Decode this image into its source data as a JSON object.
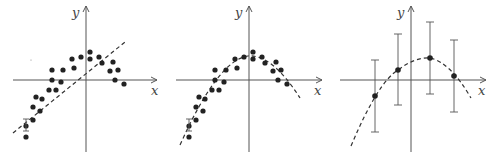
{
  "panels": [
    {
      "name": "linear-fit-underfit",
      "x_label": "x",
      "y_label": "y",
      "fit": "straight dashed line",
      "points": [
        [
          52,
          70
        ],
        [
          52,
          80
        ],
        [
          61,
          82
        ],
        [
          49,
          90
        ],
        [
          56,
          90
        ],
        [
          36,
          97
        ],
        [
          42,
          99
        ],
        [
          33,
          107
        ],
        [
          40,
          111
        ],
        [
          33,
          120
        ],
        [
          26,
          126
        ],
        [
          26,
          137
        ],
        [
          63,
          70
        ],
        [
          72,
          59
        ],
        [
          74,
          68
        ],
        [
          81,
          57
        ],
        [
          90,
          52
        ],
        [
          90,
          59
        ],
        [
          99,
          57
        ],
        [
          102,
          63
        ],
        [
          113,
          62
        ],
        [
          110,
          71
        ],
        [
          118,
          70
        ],
        [
          115,
          80
        ],
        [
          124,
          84
        ]
      ]
    },
    {
      "name": "quadratic-fit-good",
      "x_label": "x",
      "y_label": "y",
      "fit": "dashed parabola"
    },
    {
      "name": "sparse-points-with-error-bars",
      "x_label": "x",
      "y_label": "y",
      "fit": "dashed parabola through four points with error bars"
    }
  ]
}
